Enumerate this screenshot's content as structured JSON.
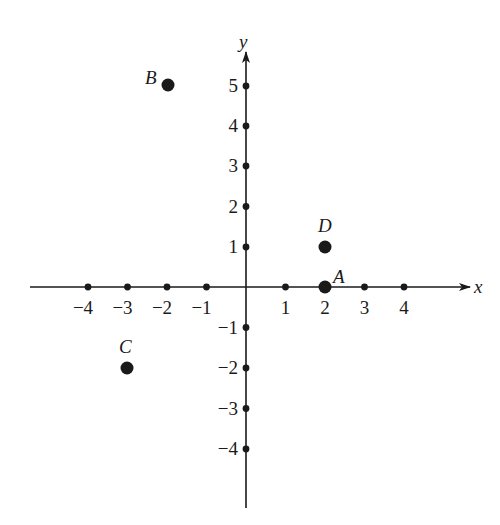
{
  "diagram": {
    "type": "coordinate-plane",
    "axes": {
      "x_label": "x",
      "y_label": "y",
      "x_ticks": [
        -4,
        -3,
        -2,
        -1,
        1,
        2,
        3,
        4
      ],
      "y_ticks": [
        5,
        4,
        3,
        2,
        1,
        -1,
        -2,
        -3,
        -4
      ],
      "x_tick_labels": [
        "−4",
        "−3",
        "−2",
        "−1",
        "1",
        "2",
        "3",
        "4"
      ],
      "y_tick_labels": [
        "5",
        "4",
        "3",
        "2",
        "1",
        "−1",
        "−2",
        "−3",
        "−4"
      ]
    },
    "points": [
      {
        "label": "A",
        "x": 2,
        "y": 0
      },
      {
        "label": "B",
        "x": -2,
        "y": 5
      },
      {
        "label": "C",
        "x": -3,
        "y": -2
      },
      {
        "label": "D",
        "x": 2,
        "y": 1
      }
    ],
    "colors": {
      "ink": "#1a1a1a",
      "background": "#ffffff"
    }
  }
}
